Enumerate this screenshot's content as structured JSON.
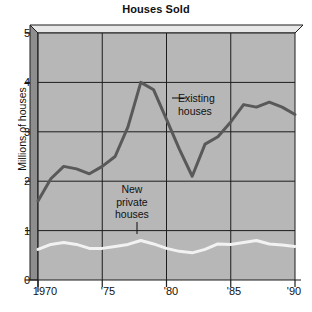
{
  "chart_data": {
    "type": "line",
    "title": "Houses Sold",
    "xlabel": "",
    "ylabel": "Millions of houses",
    "xlim": [
      1970,
      1990
    ],
    "ylim": [
      0,
      5
    ],
    "grid": true,
    "legend_position": "inline-annotations",
    "y_ticks": [
      {
        "value": 5,
        "label": "5"
      },
      {
        "value": 4,
        "label": "4"
      },
      {
        "value": 3,
        "label": "3"
      },
      {
        "value": 2,
        "label": "2"
      },
      {
        "value": 1,
        "label": "1"
      },
      {
        "value": 0,
        "label": "0"
      }
    ],
    "x_ticks": [
      {
        "value": 1970,
        "label": "1970"
      },
      {
        "value": 1975,
        "label": "'75"
      },
      {
        "value": 1980,
        "label": "'80"
      },
      {
        "value": 1985,
        "label": "'85"
      },
      {
        "value": 1990,
        "label": "'90"
      }
    ],
    "x": [
      1970,
      1971,
      1972,
      1973,
      1974,
      1975,
      1976,
      1977,
      1978,
      1979,
      1980,
      1981,
      1982,
      1983,
      1984,
      1985,
      1986,
      1987,
      1988,
      1989,
      1990
    ],
    "series": [
      {
        "name": "Existing houses",
        "color": "#595959",
        "values": [
          1.6,
          2.05,
          2.3,
          2.25,
          2.15,
          2.3,
          2.5,
          3.1,
          4.0,
          3.85,
          3.25,
          2.65,
          2.1,
          2.75,
          2.9,
          3.2,
          3.55,
          3.5,
          3.6,
          3.5,
          3.35
        ]
      },
      {
        "name": "New private houses",
        "color": "#f2f2f2",
        "values": [
          0.62,
          0.72,
          0.76,
          0.72,
          0.64,
          0.64,
          0.68,
          0.72,
          0.8,
          0.73,
          0.64,
          0.58,
          0.55,
          0.62,
          0.73,
          0.72,
          0.76,
          0.8,
          0.73,
          0.71,
          0.68
        ]
      }
    ],
    "annotations": [
      {
        "name": "existing-houses",
        "lines": [
          "Existing",
          "houses"
        ]
      },
      {
        "name": "new-private-houses",
        "lines": [
          "New",
          "private",
          "houses"
        ]
      }
    ]
  },
  "style": {
    "plot_fill": "#b7b7b7",
    "plot_top_bevel": "#e8e8e8",
    "plot_side_wall": "#8e8e8e",
    "grid_color": "#1d1d1d",
    "axis_color": "#1d1d1d"
  }
}
